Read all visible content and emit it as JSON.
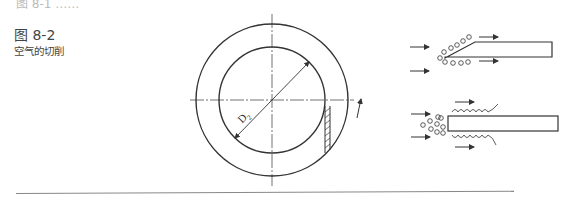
{
  "header": {
    "top_cutoff_text": "图 8-1 ……"
  },
  "figure": {
    "number": "图 8-2",
    "caption": "空气的切削",
    "diameter_label": "D",
    "diameter_subscript": "2"
  },
  "colors": {
    "line": "#333333",
    "text": "#444444",
    "rule": "#888888"
  }
}
